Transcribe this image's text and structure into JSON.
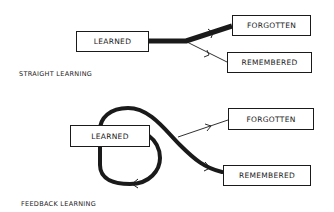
{
  "straight": {
    "caption": "STRAIGHT LEARNING",
    "nodes": {
      "learned": "LEARNED",
      "forgotten": "FORGOTTEN",
      "remembered": "REMEMBERED"
    },
    "edges": [
      {
        "from": "LEARNED",
        "to": "FORGOTTEN",
        "weight": "thick"
      },
      {
        "from": "LEARNED",
        "to": "REMEMBERED",
        "weight": "thin"
      }
    ]
  },
  "feedback": {
    "caption": "FEEDBACK LEARNING",
    "nodes": {
      "learned": "LEARNED",
      "forgotten": "FORGOTTEN",
      "remembered": "REMEMBERED"
    },
    "edges": [
      {
        "from": "LEARNED",
        "to": "LEARNED",
        "weight": "thick",
        "type": "loop"
      },
      {
        "from": "LEARNED",
        "to": "REMEMBERED",
        "weight": "thick"
      },
      {
        "from": "LEARNED",
        "to": "FORGOTTEN",
        "weight": "thin"
      }
    ]
  },
  "colors": {
    "ink": "#1a1a1a",
    "background": "#ffffff"
  }
}
